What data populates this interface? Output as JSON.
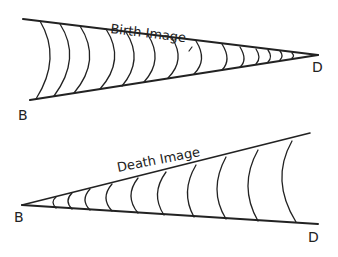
{
  "diagrams": [
    {
      "title": "Birth Image",
      "start_label": "B",
      "end_label": "D"
    },
    {
      "title": "Death Image",
      "start_label": "B",
      "end_label": "D"
    }
  ],
  "colors": {
    "ink": "#222222",
    "background": "#ffffff"
  }
}
